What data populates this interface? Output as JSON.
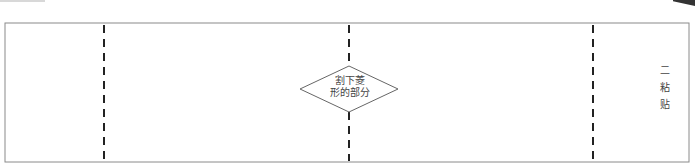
{
  "diagram": {
    "type": "fold-template",
    "panel_count": 4,
    "fold_lines": [
      "dashed",
      "dashed",
      "dashed"
    ],
    "diamond_label": {
      "line1": "割下菱",
      "line2": "形的部分"
    },
    "side_label": "二 粘 贴",
    "colors": {
      "border": "#8a8a8a",
      "dash": "#222222",
      "text": "#444444"
    }
  }
}
